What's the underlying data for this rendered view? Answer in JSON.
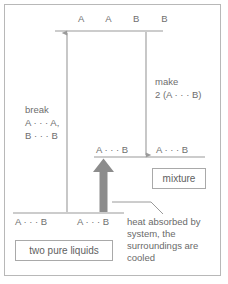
{
  "figure": {
    "border_color": "#b8b8b8",
    "line_color": "#9a9a9a",
    "text_color": "#6e6e6e",
    "thick_arrow_color": "#8c8c8c"
  },
  "levels": {
    "top": {
      "label": "A   A   B   B",
      "name": "separated-species-level"
    },
    "middle": {
      "label_left": "A · · · B",
      "label_right": "A · · · B",
      "name": "mixture-level"
    },
    "bottom": {
      "label_left": "A · · · B",
      "label_right": "A · · · B",
      "name": "pure-liquids-level"
    }
  },
  "arrows": {
    "break": {
      "label_line1": "break",
      "label_line2": "A · · · A,",
      "label_line3": "B · · · B",
      "direction": "up"
    },
    "make": {
      "label_line1": "make",
      "label_line2": "2 (A · · · B)",
      "direction": "down"
    },
    "net": {
      "direction": "up"
    }
  },
  "callouts": {
    "mixture": "mixture",
    "two_pure_liquids": "two pure liquids",
    "heat": {
      "line1": "heat absorbed by",
      "line2": "system, the",
      "line3": "surroundings are",
      "line4": "cooled"
    }
  }
}
